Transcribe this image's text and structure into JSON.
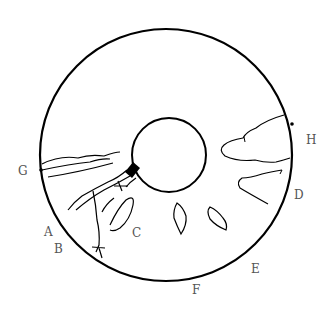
{
  "diagram": {
    "type": "fundus-drawing",
    "labels": {
      "A": "A",
      "B": "B",
      "C": "C",
      "D": "D",
      "E": "E",
      "F": "F",
      "G": "G",
      "H": "H"
    }
  }
}
